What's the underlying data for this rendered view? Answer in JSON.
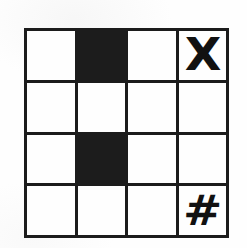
{
  "canvas": {
    "width": 247,
    "height": 248,
    "background_color": "#fefefe",
    "ink_color": "#1c1c1c"
  },
  "grid": {
    "title": "4x4 symbol grid",
    "rows": 4,
    "columns": 4,
    "line_color": "#1c1c1c",
    "line_width_px": 3,
    "cell_fill_color": "#1c1c1c",
    "cell_empty_color": "#fefefe",
    "cells": [
      {
        "row": 1,
        "col": 1,
        "state": "empty",
        "symbol": "",
        "name": "cell-r1c1"
      },
      {
        "row": 1,
        "col": 2,
        "state": "filled",
        "symbol": "",
        "name": "cell-r1c2"
      },
      {
        "row": 1,
        "col": 3,
        "state": "empty",
        "symbol": "",
        "name": "cell-r1c3"
      },
      {
        "row": 1,
        "col": 4,
        "state": "empty",
        "symbol": "X",
        "name": "cell-r1c4"
      },
      {
        "row": 2,
        "col": 1,
        "state": "empty",
        "symbol": "",
        "name": "cell-r2c1"
      },
      {
        "row": 2,
        "col": 2,
        "state": "empty",
        "symbol": "",
        "name": "cell-r2c2"
      },
      {
        "row": 2,
        "col": 3,
        "state": "empty",
        "symbol": "",
        "name": "cell-r2c3"
      },
      {
        "row": 2,
        "col": 4,
        "state": "empty",
        "symbol": "",
        "name": "cell-r2c4"
      },
      {
        "row": 3,
        "col": 1,
        "state": "empty",
        "symbol": "",
        "name": "cell-r3c1"
      },
      {
        "row": 3,
        "col": 2,
        "state": "filled",
        "symbol": "",
        "name": "cell-r3c2"
      },
      {
        "row": 3,
        "col": 3,
        "state": "empty",
        "symbol": "",
        "name": "cell-r3c3"
      },
      {
        "row": 3,
        "col": 4,
        "state": "empty",
        "symbol": "",
        "name": "cell-r3c4"
      },
      {
        "row": 4,
        "col": 1,
        "state": "empty",
        "symbol": "",
        "name": "cell-r4c1"
      },
      {
        "row": 4,
        "col": 2,
        "state": "empty",
        "symbol": "",
        "name": "cell-r4c2"
      },
      {
        "row": 4,
        "col": 3,
        "state": "empty",
        "symbol": "",
        "name": "cell-r4c3"
      },
      {
        "row": 4,
        "col": 4,
        "state": "empty",
        "symbol": "#",
        "name": "cell-r4c4"
      }
    ]
  }
}
